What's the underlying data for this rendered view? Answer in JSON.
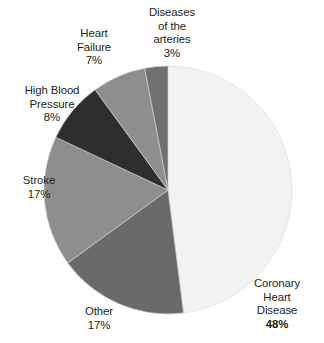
{
  "chart_data": {
    "type": "pie",
    "title": "",
    "subtitle": "",
    "xlabel": "",
    "ylabel": "",
    "legend_position": "none",
    "grid": false,
    "labels_position": "outside",
    "start_angle_deg": 0,
    "direction": "clockwise",
    "categories": [
      "Coronary Heart Disease",
      "Other",
      "Stroke",
      "High Blood Pressure",
      "Heart Failure",
      "Diseases of the arteries"
    ],
    "values": [
      48,
      17,
      17,
      8,
      7,
      3
    ],
    "units": "%",
    "slices": [
      {
        "id": "coronary-heart-disease",
        "label_lines": [
          "Coronary",
          "Heart",
          "Disease"
        ],
        "percent_text": "48%",
        "value": 48,
        "color": "#f2f2f0",
        "emphasis": true
      },
      {
        "id": "other",
        "label_lines": [
          "Other"
        ],
        "percent_text": "17%",
        "value": 17,
        "color": "#6a6a6a",
        "emphasis": false
      },
      {
        "id": "stroke",
        "label_lines": [
          "Stroke"
        ],
        "percent_text": "17%",
        "value": 17,
        "color": "#8e8e8e",
        "emphasis": false
      },
      {
        "id": "high-blood-pressure",
        "label_lines": [
          "High Blood",
          "Pressure"
        ],
        "percent_text": "8%",
        "value": 8,
        "color": "#2e2e2e",
        "emphasis": false
      },
      {
        "id": "heart-failure",
        "label_lines": [
          "Heart",
          "Failure"
        ],
        "percent_text": "7%",
        "value": 7,
        "color": "#8e8e8e",
        "emphasis": false
      },
      {
        "id": "diseases-of-the-arteries",
        "label_lines": [
          "Diseases",
          "of the",
          "arteries"
        ],
        "percent_text": "3%",
        "value": 3,
        "color": "#707070",
        "emphasis": false
      }
    ],
    "colors": {
      "background": "#ffffff",
      "text": "#231f20",
      "slice_outline": "#d9d9d9"
    }
  },
  "labels": {
    "arteries": {
      "line1": "Diseases",
      "line2": "of the",
      "line3": "arteries",
      "pct": "3%"
    },
    "heart_failure": {
      "line1": "Heart",
      "line2": "Failure",
      "pct": "7%"
    },
    "high_bp": {
      "line1": "High Blood",
      "line2": "Pressure",
      "pct": "8%"
    },
    "stroke": {
      "line1": "Stroke",
      "pct": "17%"
    },
    "other": {
      "line1": "Other",
      "pct": "17%"
    },
    "chd": {
      "line1": "Coronary",
      "line2": "Heart",
      "line3": "Disease",
      "pct": "48%"
    }
  }
}
